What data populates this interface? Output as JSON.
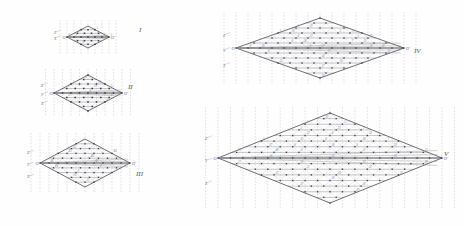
{
  "figure": {
    "title": "",
    "background": "#fefefe",
    "ink": "#6e6e74",
    "node_color": "#3a3a3f",
    "hull_color": "#4a4a50",
    "grid_color": "#c8c8cc",
    "dash_color": "#b4b4ba"
  },
  "panels": [
    {
      "id": "I",
      "roman": "I",
      "roman_pos": {
        "x": 139,
        "y": 32
      },
      "center": {
        "x": 88,
        "y": 37
      },
      "cols": 3,
      "rows": 3,
      "cell_w": 21,
      "cell_h": 11,
      "hull_radius_x": 21,
      "hull_radius_y": 11,
      "node_labels": [
        "1",
        "2",
        "3",
        "4",
        "5",
        "6",
        "7"
      ],
      "axis_labels": [
        "Z",
        "X"
      ],
      "vertex_labels": [
        "O",
        "O'"
      ]
    },
    {
      "id": "II",
      "roman": "II",
      "roman_pos": {
        "x": 128,
        "y": 89
      },
      "center": {
        "x": 88,
        "y": 93
      },
      "cols": 4,
      "rows": 4,
      "cell_w": 17,
      "cell_h": 9,
      "hull_radius_x": 34,
      "hull_radius_y": 18,
      "node_labels": [
        "1",
        "2",
        "3",
        "4",
        "5",
        "6",
        "8",
        "9",
        "10",
        "12"
      ],
      "axis_labels": [
        "Z",
        "Y",
        "X"
      ],
      "vertex_labels": [
        "O",
        "O'"
      ]
    },
    {
      "id": "III",
      "roman": "III",
      "roman_pos": {
        "x": 136,
        "y": 176
      },
      "center": {
        "x": 85,
        "y": 163
      },
      "cols": 5,
      "rows": 5,
      "cell_w": 15,
      "cell_h": 8,
      "hull_radius_x": 45,
      "hull_radius_y": 24,
      "node_labels": [
        "1",
        "2",
        "3",
        "4",
        "5",
        "6",
        "7",
        "8",
        "9",
        "10",
        "11",
        "12",
        "13",
        "14",
        "15",
        "16",
        "17",
        "18"
      ],
      "axis_labels": [
        "Z",
        "Y",
        "X"
      ],
      "vertex_labels": [
        "O",
        "O'"
      ]
    },
    {
      "id": "IV",
      "roman": "IV",
      "roman_pos": {
        "x": 414,
        "y": 53
      },
      "center": {
        "x": 320,
        "y": 48
      },
      "cols": 7,
      "rows": 6,
      "cell_w": 14,
      "cell_h": 7.5,
      "hull_radius_x": 84,
      "hull_radius_y": 30,
      "node_labels": [
        "1",
        "2",
        "3",
        "4",
        "5",
        "6",
        "7",
        "8",
        "9",
        "10",
        "11",
        "12",
        "13",
        "14",
        "15",
        "16",
        "17",
        "18",
        "19",
        "20",
        "21",
        "22",
        "23",
        "24",
        "25",
        "26",
        "27",
        "28"
      ],
      "axis_labels": [
        "Z",
        "Y",
        "X"
      ],
      "vertex_labels": [
        "O",
        "O'"
      ]
    },
    {
      "id": "V",
      "roman": "V",
      "roman_pos": {
        "x": 444,
        "y": 156
      },
      "center": {
        "x": 330,
        "y": 158
      },
      "cols": 9,
      "rows": 8,
      "cell_w": 14,
      "cell_h": 7.5,
      "hull_radius_x": 112,
      "hull_radius_y": 45,
      "node_labels": [
        "1",
        "2",
        "3",
        "4",
        "5",
        "6",
        "7",
        "8",
        "9",
        "10",
        "11",
        "12",
        "13",
        "14",
        "15",
        "16",
        "17",
        "18",
        "19",
        "20",
        "21",
        "22",
        "23",
        "24",
        "25",
        "26",
        "27",
        "28",
        "29",
        "30",
        "31",
        "32",
        "33",
        "34",
        "35",
        "36",
        "37",
        "38",
        "39",
        "40"
      ],
      "axis_labels": [
        "Z",
        "Y",
        "X"
      ],
      "vertex_labels": [
        "O",
        "O'"
      ]
    }
  ],
  "chart_data": {
    "type": "scatter",
    "title": "",
    "xlabel": "X",
    "ylabel": "Z",
    "series": [
      {
        "name": "I",
        "node_count": 7,
        "hull": "rhombus"
      },
      {
        "name": "II",
        "node_count": 19,
        "hull": "rhombus"
      },
      {
        "name": "III",
        "node_count": 37,
        "hull": "rhombus"
      },
      {
        "name": "IV",
        "node_count": 61,
        "hull": "rhombus"
      },
      {
        "name": "V",
        "node_count": 91,
        "hull": "rhombus"
      }
    ]
  }
}
